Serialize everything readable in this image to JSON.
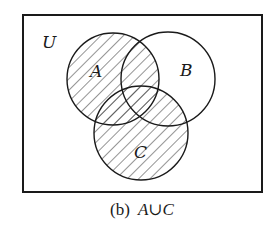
{
  "figure": {
    "universe_label": "U",
    "sets": [
      {
        "id": "A",
        "label": "A",
        "cx": 113,
        "cy": 79,
        "r": 46,
        "shaded": true
      },
      {
        "id": "B",
        "label": "B",
        "cx": 168,
        "cy": 79,
        "r": 47,
        "shaded": false
      },
      {
        "id": "C",
        "label": "C",
        "cx": 141,
        "cy": 133,
        "r": 47,
        "shaded": true
      }
    ],
    "shaded_region": "A ∪ C",
    "caption": {
      "tag": "(b)",
      "expression": "A∪C"
    },
    "colors": {
      "stroke": "#1a1a1a",
      "hatch": "#3a3a3a",
      "background": "#ffffff"
    }
  }
}
